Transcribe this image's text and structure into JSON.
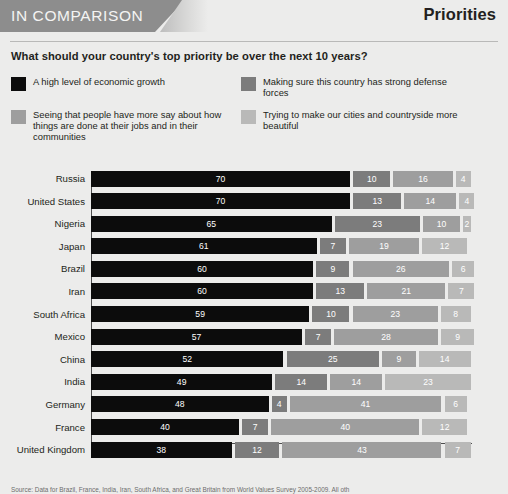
{
  "header": {
    "banner_label": "IN COMPARISON",
    "section_title": "Priorities"
  },
  "question": "What should your country's top priority be over the next 10 years?",
  "legend": [
    {
      "label": "A high level of economic growth",
      "color": "#0c0c0c",
      "swatch_name": "legend-swatch-economic-growth"
    },
    {
      "label": "Making sure this country has strong defense forces",
      "color": "#7c7c7c",
      "swatch_name": "legend-swatch-defense-forces"
    },
    {
      "label": "Seeing that people have more say about how things are done at their jobs and in their communities",
      "color": "#9e9e9e",
      "swatch_name": "legend-swatch-more-say"
    },
    {
      "label": "Trying to make our cities and countryside more beautiful",
      "color": "#b9b9b8",
      "swatch_name": "legend-swatch-more-beautiful"
    }
  ],
  "source": "Source: Data for Brazil, France, India, Iran, South Africa, and Great Britain from World Values Survey 2005-2009. All oth",
  "chart_data": {
    "type": "bar",
    "subtype": "stacked-horizontal-100",
    "title": "What should your country's top priority be over the next 10 years?",
    "xlabel": "",
    "ylabel": "",
    "xlim": [
      0,
      100
    ],
    "grid": false,
    "legend_position": "top",
    "categories": [
      "Russia",
      "United States",
      "Nigeria",
      "Japan",
      "Brazil",
      "Iran",
      "South Africa",
      "Mexico",
      "China",
      "India",
      "Germany",
      "France",
      "United Kingdom"
    ],
    "series": [
      {
        "name": "A high level of economic growth",
        "color": "#0c0c0c",
        "values": [
          70,
          70,
          65,
          61,
          60,
          60,
          59,
          57,
          52,
          49,
          48,
          40,
          38
        ]
      },
      {
        "name": "Making sure this country has strong defense forces",
        "color": "#7c7c7c",
        "values": [
          10,
          13,
          23,
          7,
          9,
          13,
          10,
          7,
          25,
          14,
          4,
          7,
          12
        ]
      },
      {
        "name": "Seeing that people have more say about how things are done at their jobs and in their communities",
        "color": "#9e9e9e",
        "values": [
          16,
          14,
          10,
          19,
          26,
          21,
          23,
          28,
          9,
          14,
          41,
          40,
          43
        ]
      },
      {
        "name": "Trying to make our cities and countryside more beautiful",
        "color": "#b9b9b8",
        "values": [
          4,
          4,
          2,
          12,
          6,
          7,
          8,
          9,
          14,
          23,
          6,
          12,
          7
        ]
      }
    ],
    "rows": [
      {
        "country": "Russia",
        "values": [
          70,
          10,
          16,
          4
        ]
      },
      {
        "country": "United States",
        "values": [
          70,
          13,
          14,
          4
        ]
      },
      {
        "country": "Nigeria",
        "values": [
          65,
          23,
          10,
          2
        ]
      },
      {
        "country": "Japan",
        "values": [
          61,
          7,
          19,
          12
        ]
      },
      {
        "country": "Brazil",
        "values": [
          60,
          9,
          26,
          6
        ]
      },
      {
        "country": "Iran",
        "values": [
          60,
          13,
          21,
          7
        ]
      },
      {
        "country": "South Africa",
        "values": [
          59,
          10,
          23,
          8
        ]
      },
      {
        "country": "Mexico",
        "values": [
          57,
          7,
          28,
          9
        ]
      },
      {
        "country": "China",
        "values": [
          52,
          25,
          9,
          14
        ]
      },
      {
        "country": "India",
        "values": [
          49,
          14,
          14,
          23
        ]
      },
      {
        "country": "Germany",
        "values": [
          48,
          4,
          41,
          6
        ]
      },
      {
        "country": "France",
        "values": [
          40,
          7,
          40,
          12
        ]
      },
      {
        "country": "United Kingdom",
        "values": [
          38,
          12,
          43,
          7
        ]
      }
    ]
  }
}
